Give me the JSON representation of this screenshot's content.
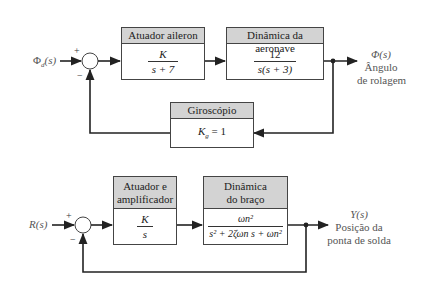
{
  "diagram_top": {
    "input_label": "Φd(s)",
    "input_symbol": "Φ",
    "input_subscript": "d",
    "input_arg": "(s)",
    "sum_plus": "+",
    "sum_minus": "−",
    "blocks": [
      {
        "title": "Atuador aileron",
        "numerator": "K",
        "denominator": "s + 7"
      },
      {
        "title": "Dinâmica da aeronave",
        "numerator": "12",
        "denominator": "s(s + 3)"
      }
    ],
    "feedback_block": {
      "title": "Giroscópio",
      "gain_symbol": "K",
      "gain_subscript": "g",
      "gain_value": "= 1"
    },
    "output": {
      "symbol": "Φ(s)",
      "line1": "Ângulo",
      "line2": "de rolagem"
    }
  },
  "diagram_bottom": {
    "input_label": "R(s)",
    "sum_plus": "+",
    "sum_minus": "−",
    "blocks": [
      {
        "title_line1": "Atuador e",
        "title_line2": "amplificador",
        "numerator": "K",
        "denominator": "s"
      },
      {
        "title_line1": "Dinâmica",
        "title_line2": "do braço",
        "numerator": "ωn²",
        "denominator": "s² + 2ζωn s + ωn²"
      }
    ],
    "output": {
      "symbol": "Y(s)",
      "line1": "Posição da",
      "line2": "ponta de solda"
    }
  },
  "colors": {
    "line": "#222222",
    "header_fill": "#d3d3d3",
    "label_text": "#555555"
  }
}
